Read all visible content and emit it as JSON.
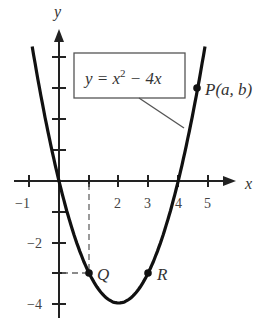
{
  "chart_data": {
    "type": "line",
    "title": "",
    "function": "y = x^2 - 4x",
    "xlabel": "x",
    "ylabel": "y",
    "xlim": [
      -1.2,
      5.8
    ],
    "ylim": [
      -4.5,
      5
    ],
    "x_tick_labels": [
      "-1",
      "2",
      "3",
      "4",
      "5"
    ],
    "y_tick_labels": [
      "-2",
      "-4"
    ],
    "x_ticks": [
      -1,
      1,
      2,
      3,
      4,
      5
    ],
    "y_ticks": [
      -4,
      -3,
      -2,
      -1,
      1,
      2,
      3,
      4
    ],
    "grid": false,
    "points": [
      {
        "label": "P(a, b)",
        "x": 4.6,
        "y": 2.8
      },
      {
        "label": "Q",
        "x": 1,
        "y": -3
      },
      {
        "label": "R",
        "x": 3,
        "y": -3
      }
    ],
    "curve_samples": {
      "x": [
        -0.9,
        -0.5,
        0,
        0.5,
        1,
        1.5,
        2,
        2.5,
        3,
        3.5,
        4,
        4.5,
        4.9
      ],
      "y": [
        4.41,
        2.25,
        0,
        -1.75,
        -3,
        -3.75,
        -4,
        -3.75,
        -3,
        -1.75,
        0,
        2.25,
        4.41
      ]
    },
    "annotations": [
      "dashed guide lines from Q to x=1 on x-axis and y=-3 on y-axis",
      "callout box with equation pointing to curve"
    ]
  },
  "labels": {
    "equation": "y = x",
    "equation_exp": "2",
    "equation_tail": " − 4x",
    "x_axis": "x",
    "y_axis": "y",
    "point_p": "P(a, b)",
    "point_q": "Q",
    "point_r": "R",
    "tick_m1": "−1",
    "tick_2": "2",
    "tick_3": "3",
    "tick_4": "4",
    "tick_5": "5",
    "tick_ym2": "−2",
    "tick_ym4": "−4"
  }
}
